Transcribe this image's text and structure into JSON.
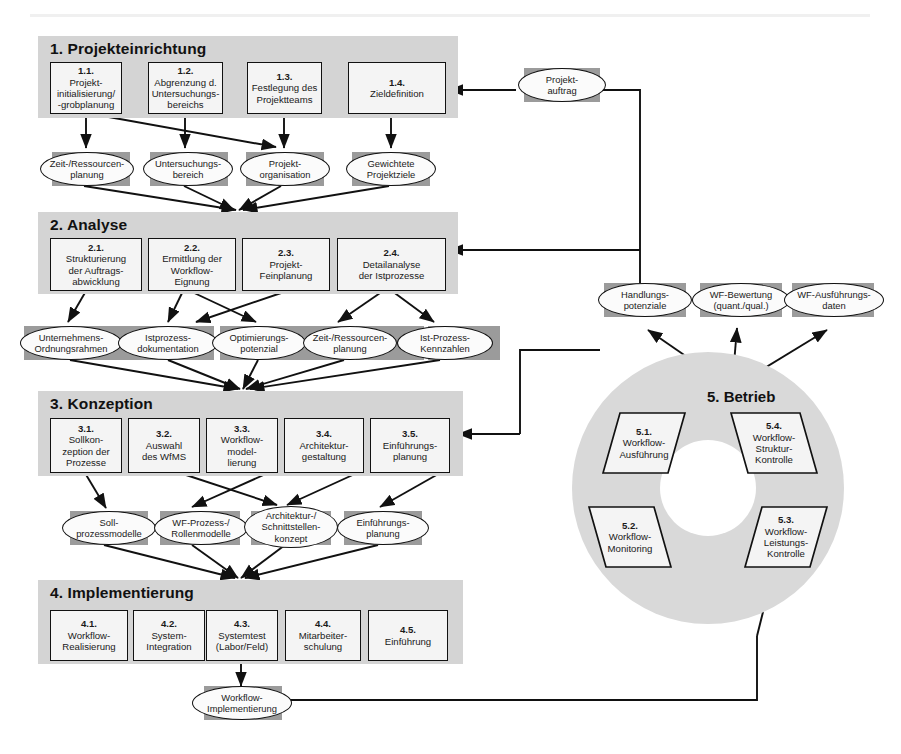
{
  "phases": [
    {
      "id": "phase-1",
      "title": "1. Projekteinrichtung",
      "activities": [
        {
          "num": "1.1.",
          "lines": [
            "Projekt-",
            "initialisierung/",
            "-grobplanung"
          ]
        },
        {
          "num": "1.2.",
          "lines": [
            "Abgrenzung d.",
            "Untersuchungs-",
            "bereichs"
          ]
        },
        {
          "num": "1.3.",
          "lines": [
            "Festlegung des",
            "Projektteams"
          ]
        },
        {
          "num": "1.4.",
          "lines": [
            "Zieldefinition"
          ]
        }
      ],
      "results": [
        {
          "lines": [
            "Zeit-/Ressourcen-",
            "planung"
          ]
        },
        {
          "lines": [
            "Untersuchungs-",
            "bereich"
          ]
        },
        {
          "lines": [
            "Projekt-",
            "organisation"
          ]
        },
        {
          "lines": [
            "Gewichtete",
            "Projektziele"
          ]
        }
      ]
    },
    {
      "id": "phase-2",
      "title": "2. Analyse",
      "activities": [
        {
          "num": "2.1.",
          "lines": [
            "Strukturierung",
            "der Auftrags-",
            "abwicklung"
          ]
        },
        {
          "num": "2.2.",
          "lines": [
            "Ermittlung der",
            "Workflow-",
            "Eignung"
          ]
        },
        {
          "num": "2.3.",
          "lines": [
            "Projekt-",
            "Feinplanung"
          ]
        },
        {
          "num": "2.4.",
          "lines": [
            "Detailanalyse",
            "der Istprozesse"
          ]
        }
      ],
      "results": [
        {
          "lines": [
            "Unternehmens-",
            "Ordnungsrahmen"
          ]
        },
        {
          "lines": [
            "Istprozess-",
            "dokumentation"
          ]
        },
        {
          "lines": [
            "Optimierungs-",
            "potenzial"
          ]
        },
        {
          "lines": [
            "Zeit-/Ressourcen-",
            "planung"
          ]
        },
        {
          "lines": [
            "Ist-Prozess-",
            "Kennzahlen"
          ]
        }
      ]
    },
    {
      "id": "phase-3",
      "title": "3. Konzeption",
      "activities": [
        {
          "num": "3.1.",
          "lines": [
            "Sollkon-",
            "zeption der",
            "Prozesse"
          ]
        },
        {
          "num": "3.2.",
          "lines": [
            "Auswahl",
            "des WfMS"
          ]
        },
        {
          "num": "3.3.",
          "lines": [
            "Workflow-",
            "model-",
            "lierung"
          ]
        },
        {
          "num": "3.4.",
          "lines": [
            "Architektur-",
            "gestaltung"
          ]
        },
        {
          "num": "3.5.",
          "lines": [
            "Einführungs-",
            "planung"
          ]
        }
      ],
      "results": [
        {
          "lines": [
            "Soll-",
            "prozessmodelle"
          ]
        },
        {
          "lines": [
            "WF-Prozess-/",
            "Rollenmodelle"
          ]
        },
        {
          "lines": [
            "Architektur-/",
            "Schnittstellen-",
            "konzept"
          ]
        },
        {
          "lines": [
            "Einführungs-",
            "planung"
          ]
        }
      ]
    },
    {
      "id": "phase-4",
      "title": "4. Implementierung",
      "activities": [
        {
          "num": "4.1.",
          "lines": [
            "Workflow-",
            "Realisierung"
          ]
        },
        {
          "num": "4.2.",
          "lines": [
            "System-",
            "Integration"
          ]
        },
        {
          "num": "4.3.",
          "lines": [
            "Systemtest",
            "(Labor/Feld)"
          ]
        },
        {
          "num": "4.4.",
          "lines": [
            "Mitarbeiter-",
            "schulung"
          ]
        },
        {
          "num": "4.5.",
          "lines": [
            "Einführung"
          ]
        }
      ],
      "results": [
        {
          "lines": [
            "Workflow-",
            "Implementierung"
          ]
        }
      ]
    }
  ],
  "operation": {
    "title": "5. Betrieb",
    "steps": [
      {
        "num": "5.1.",
        "lines": [
          "Workflow-",
          "Ausführung"
        ]
      },
      {
        "num": "5.2.",
        "lines": [
          "Workflow-",
          "Monitoring"
        ]
      },
      {
        "num": "5.3.",
        "lines": [
          "Workflow-",
          "Leistungs-",
          "Kontrolle"
        ]
      },
      {
        "num": "5.4.",
        "lines": [
          "Workflow-",
          "Struktur-",
          "Kontrolle"
        ]
      }
    ],
    "results": [
      {
        "lines": [
          "Handlungs-",
          "potenziale"
        ]
      },
      {
        "lines": [
          "WF-Bewertung",
          "(quant./qual.)"
        ]
      },
      {
        "lines": [
          "WF-Ausführungs-",
          "daten"
        ]
      }
    ]
  },
  "input": {
    "lines": [
      "Projekt-",
      "auftrag"
    ]
  },
  "caption": "",
  "colors": {
    "phase_band": "#d4d4d4",
    "activity_box": "#f4f4f4",
    "result_shadow": "#9b9b9b",
    "result_fill": "#fbfbfb",
    "ring": "#d9d9d9",
    "line": "#111111"
  }
}
